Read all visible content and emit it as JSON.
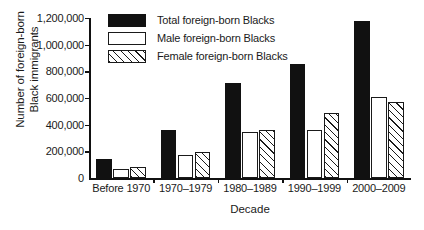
{
  "chart_data": {
    "type": "bar",
    "title": "",
    "xlabel": "Decade",
    "ylabel_lines": [
      "Number of foreign-born",
      "Black immigrants"
    ],
    "ylabel": "Number of foreign-born Black immigrants",
    "categories": [
      "Before 1970",
      "1970–1979",
      "1980–1989",
      "1990–1999",
      "2000–2009"
    ],
    "series": [
      {
        "name": "Total foreign-born Blacks",
        "key": "total",
        "values": [
          140000,
          360000,
          710000,
          855000,
          1175000
        ]
      },
      {
        "name": "Male foreign-born Blacks",
        "key": "male",
        "values": [
          65000,
          170000,
          345000,
          360000,
          605000
        ]
      },
      {
        "name": "Female foreign-born Blacks",
        "key": "female",
        "values": [
          80000,
          195000,
          360000,
          490000,
          570000
        ]
      }
    ],
    "ylim": [
      0,
      1200000
    ],
    "yticks": [
      0,
      200000,
      400000,
      600000,
      800000,
      1000000,
      1200000
    ],
    "ytick_labels": [
      "0",
      "200,000",
      "400,000",
      "600,000",
      "800,000",
      "1,000,000",
      "1,200,000"
    ],
    "grid": false,
    "legend_position": "top-left-inside",
    "colors": {
      "total": "#111111",
      "male": "#ffffff",
      "female": "#ffffff",
      "outline": "#1a1a1a",
      "background": "#ffffff"
    }
  },
  "legend": {
    "entries": [
      {
        "label": "Total foreign-born Blacks",
        "key": "total"
      },
      {
        "label": "Male foreign-born Blacks",
        "key": "male"
      },
      {
        "label": "Female foreign-born Blacks",
        "key": "female"
      }
    ]
  }
}
